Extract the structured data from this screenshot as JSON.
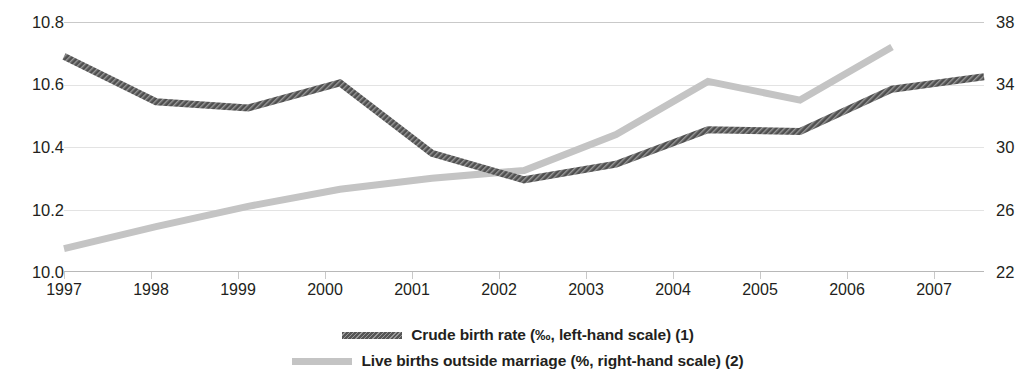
{
  "chart_data": {
    "type": "line",
    "title": "",
    "xlabel": "",
    "ylabel": "",
    "grid": true,
    "legend_position": "bottom-center",
    "categories": [
      "1997",
      "1998",
      "1999",
      "2000",
      "2001",
      "2002",
      "2003",
      "2004",
      "2005",
      "2006",
      "2007"
    ],
    "axes": {
      "left": {
        "label": "Crude birth rate (‰)",
        "ticks": [
          "10.0",
          "10.2",
          "10.4",
          "10.6",
          "10.8"
        ],
        "tick_values": [
          10.0,
          10.2,
          10.4,
          10.6,
          10.8
        ],
        "ylim": [
          10.0,
          10.8
        ]
      },
      "right": {
        "label": "Live births outside marriage (%)",
        "ticks": [
          "22",
          "26",
          "30",
          "34",
          "38"
        ],
        "tick_values": [
          22,
          26,
          30,
          34,
          38
        ],
        "ylim": [
          22,
          38
        ]
      }
    },
    "series": [
      {
        "name": "Crude birth rate (‰, left-hand scale) (1)",
        "axis": "left",
        "color": "#565656",
        "style": "hatched-thick",
        "x": [
          "1997",
          "1998",
          "1999",
          "2000",
          "2001",
          "2002",
          "2003",
          "2004",
          "2005",
          "2006",
          "2007"
        ],
        "values": [
          10.69,
          10.545,
          10.525,
          10.605,
          10.38,
          10.295,
          10.345,
          10.455,
          10.45,
          10.585,
          10.625
        ]
      },
      {
        "name": "Live births outside marriage (%, right-hand scale) (2)",
        "axis": "right",
        "color": "#c4c4c4",
        "style": "solid-thick",
        "x": [
          "1997",
          "1998",
          "1999",
          "2000",
          "2001",
          "2002",
          "2003",
          "2004",
          "2005",
          "2006"
        ],
        "values": [
          23.5,
          24.9,
          26.2,
          27.3,
          28.0,
          28.5,
          30.8,
          34.2,
          33.0,
          36.4
        ]
      }
    ]
  },
  "legend": {
    "items": [
      {
        "label": "Crude birth rate (‰, left-hand scale) (1)",
        "color": "#565656"
      },
      {
        "label": "Live births outside marriage (%, right-hand scale) (2)",
        "color": "#c4c4c4"
      }
    ]
  },
  "colors": {
    "series_dark": "#565656",
    "series_light": "#c4c4c4",
    "grid": "#e3e3e3",
    "axis": "#b8b8b8",
    "text": "#231f20",
    "background": "#ffffff"
  }
}
